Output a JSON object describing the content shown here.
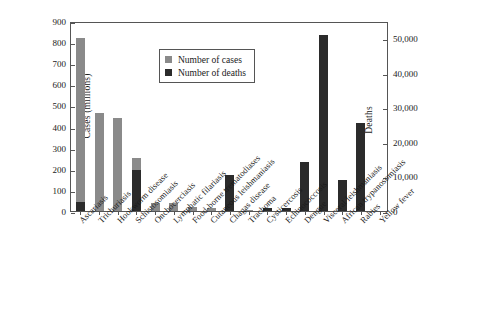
{
  "chart_data": {
    "type": "bar",
    "title": "",
    "xlabel": "",
    "ylabel": "Cases (millions)",
    "ylabel_right": "Deaths",
    "ylim": [
      0,
      900
    ],
    "ylim_right": [
      0,
      55000
    ],
    "yticks": [
      0,
      100,
      200,
      300,
      400,
      500,
      600,
      700,
      800,
      900
    ],
    "yticks_right": [
      0,
      10000,
      20000,
      30000,
      40000,
      50000
    ],
    "yticklabels_right": [
      "0",
      "10,000",
      "20,000",
      "30,000",
      "40,000",
      "50,000"
    ],
    "grid": false,
    "legend_position": "upper-left-inside",
    "categories": [
      "Ascariasis",
      "Trichuriasis",
      "Hookworm disease",
      "Schistosomiasis",
      "Onchocerciasis",
      "Lymphatic filariasis",
      "Food-borne trematodiases",
      "Cutaneous leishmaniasis",
      "Chagas disease",
      "Trachoma",
      "Cysticercosis",
      "Echinococcosis",
      "Dengue",
      "Visceral leishmaniasis",
      "African trypanosomiasis",
      "Rabies",
      "Yellow fever"
    ],
    "series": [
      {
        "name": "Number of cases",
        "color": "#8a8a8a",
        "axis": "left",
        "unit": "millions",
        "values": [
          820,
          465,
          440,
          250,
          37,
          40,
          20,
          12,
          0,
          5,
          0,
          0,
          0,
          0,
          0,
          0,
          0
        ]
      },
      {
        "name": "Number of deaths",
        "color": "#2b2b2b",
        "axis": "right",
        "unit": "deaths",
        "values": [
          2500,
          0,
          0,
          11800,
          0,
          0,
          0,
          0,
          10300,
          0,
          900,
          900,
          14300,
          51000,
          9000,
          25500,
          0
        ]
      }
    ]
  },
  "legend": {
    "items": [
      {
        "label": "Number of cases",
        "color": "#8a8a8a"
      },
      {
        "label": "Number of deaths",
        "color": "#2b2b2b"
      }
    ]
  }
}
